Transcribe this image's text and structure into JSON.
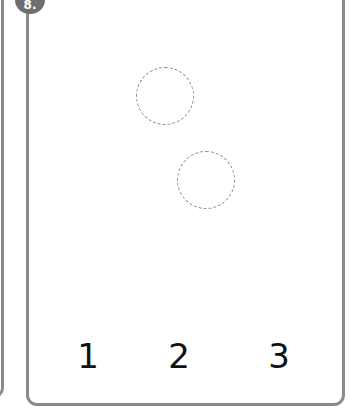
{
  "card": {
    "badge": "8.",
    "circles": [
      {
        "cx": 165,
        "cy": 96
      },
      {
        "cx": 206,
        "cy": 180
      }
    ],
    "numbers": [
      "1",
      "2",
      "3"
    ]
  },
  "colors": {
    "border": "#8a8a8a",
    "badge": "#6e6e6e",
    "text": "#111111"
  }
}
